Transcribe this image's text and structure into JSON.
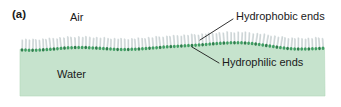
{
  "figure": {
    "panel_letter": "(a)",
    "labels": {
      "air": "Air",
      "water": "Water",
      "hydrophobic": "Hydrophobic ends",
      "hydrophilic": "Hydrophilic ends"
    },
    "colors": {
      "water_fill": "#c6e3cd",
      "water_edge": "#b2d8bb",
      "head": "#3f9e63",
      "head_dark": "#2e7d4c",
      "tail": "#d8dfe0",
      "tail_edge": "#aeb8ba",
      "text": "#1a1a1a",
      "leader_line": "#1a1a1a",
      "background": "#ffffff"
    },
    "diagram": {
      "subject": "surfactant monolayer at air-water interface",
      "molecule_count": 86,
      "water_region": {
        "x": 20,
        "y": 44,
        "width": 305,
        "height": 52
      },
      "surface_profile_note": "gently undulating wave; crest near left, trough near x=200, crest near x=250"
    },
    "leaders": [
      {
        "name": "hydrophobic-leader",
        "x1": 233,
        "y1": 19,
        "x2": 200,
        "y2": 40
      },
      {
        "name": "hydrophilic-leader",
        "x1": 219,
        "y1": 63,
        "x2": 192,
        "y2": 47
      }
    ]
  }
}
